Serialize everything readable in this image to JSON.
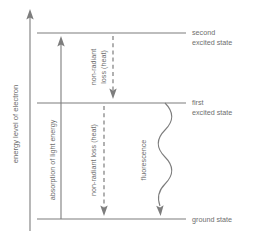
{
  "diagram": {
    "axis": {
      "label": "energy level of electron",
      "direction": "up",
      "arrow_icon": "arrow-up-icon"
    },
    "colors": {
      "line": "#7d7d7d",
      "text": "#6e6e6e",
      "background": "#ffffff"
    },
    "levels": [
      {
        "id": "second-excited-state",
        "label_line1": "second",
        "label_line2": "excited state",
        "y": 33
      },
      {
        "id": "first-excited-state",
        "label_line1": "first",
        "label_line2": "excited state",
        "y": 103
      },
      {
        "id": "ground-state",
        "label_line1": "ground state",
        "label_line2": "",
        "y": 219
      }
    ],
    "processes": [
      {
        "id": "absorption",
        "label_line1": "absorption of light energy",
        "label_line2": "",
        "style": "solid",
        "direction": "up",
        "from_level": "ground-state",
        "to_level": "second-excited-state"
      },
      {
        "id": "non-radiant-loss-upper",
        "label_line1": "non-radiant",
        "label_line2": "loss (heat)",
        "style": "dashed",
        "direction": "down",
        "from_level": "second-excited-state",
        "to_level": "first-excited-state"
      },
      {
        "id": "non-radiant-loss-lower",
        "label_line1": "non-radiant loss (heat)",
        "label_line2": "",
        "style": "dashed",
        "direction": "down",
        "from_level": "first-excited-state",
        "to_level": "ground-state"
      },
      {
        "id": "fluorescence",
        "label_line1": "fluorescence",
        "label_line2": "",
        "style": "wavy",
        "direction": "down",
        "from_level": "first-excited-state",
        "to_level": "ground-state"
      }
    ]
  }
}
